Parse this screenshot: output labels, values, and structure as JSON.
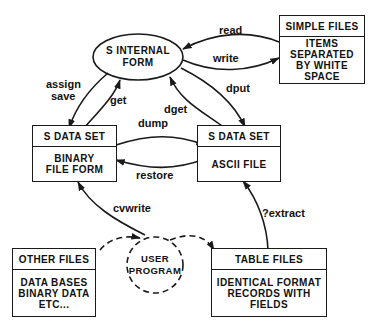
{
  "nodes": {
    "internal_form": {
      "line1": "S INTERNAL",
      "line2": "FORM"
    },
    "simple_files": {
      "header": "SIMPLE FILES",
      "body": [
        "ITEMS",
        "SEPARATED",
        "BY WHITE",
        "SPACE"
      ]
    },
    "binary_dataset": {
      "header": "S DATA SET",
      "body": [
        "BINARY",
        "FILE FORM"
      ]
    },
    "ascii_dataset": {
      "header": "S DATA SET",
      "body": [
        "ASCII FILE"
      ]
    },
    "other_files": {
      "header": "OTHER FILES",
      "body": [
        "DATA BASES",
        "BINARY DATA",
        "ETC..."
      ]
    },
    "user_program": {
      "line1": "USER",
      "line2": "PROGRAM"
    },
    "table_files": {
      "header": "TABLE FILES",
      "body": [
        "IDENTICAL FORMAT",
        "RECORDS WITH",
        "FIELDS"
      ]
    }
  },
  "edges": {
    "read": "read",
    "write": "write",
    "assign": "assign",
    "save": "save",
    "get": "get",
    "dget": "dget",
    "dput": "dput",
    "dump": "dump",
    "restore": "restore",
    "cvwrite": "cvwrite",
    "extract": "?extract"
  },
  "colors": {
    "line": "#1a1a1a",
    "background": "#ffffff"
  }
}
